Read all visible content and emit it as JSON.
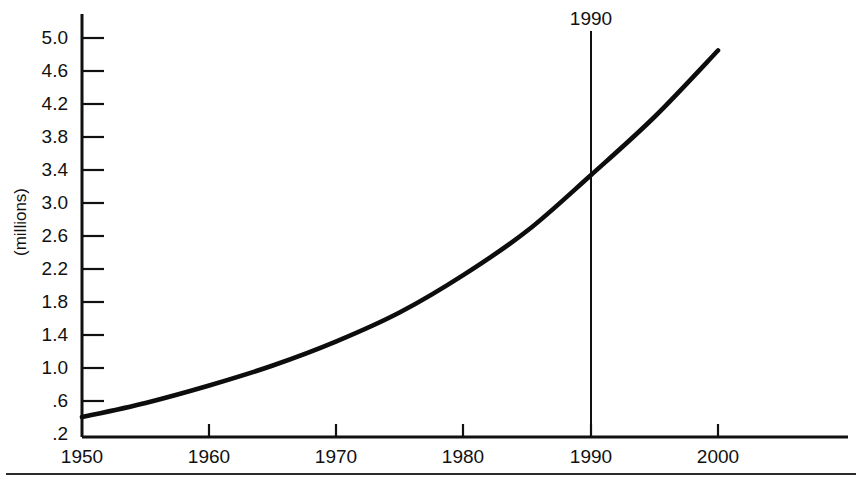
{
  "chart_data": {
    "type": "line",
    "title": "",
    "xlabel": "",
    "ylabel": "(millions)",
    "xlim": [
      1950,
      2006
    ],
    "ylim": [
      0.2,
      5.2
    ],
    "grid": false,
    "legend": null,
    "x_tick_labels": [
      "1950",
      "1960",
      "1970",
      "1980",
      "1990",
      "2000"
    ],
    "x_ticks": [
      1950,
      1960,
      1970,
      1980,
      1990,
      2000
    ],
    "y_tick_labels": [
      ".2",
      ".6",
      "1.0",
      "1.4",
      "1.8",
      "2.2",
      "2.6",
      "3.0",
      "3.4",
      "3.8",
      "4.2",
      "4.6",
      "5.0"
    ],
    "y_ticks": [
      0.2,
      0.6,
      1.0,
      1.4,
      1.8,
      2.2,
      2.6,
      3.0,
      3.4,
      3.8,
      4.2,
      4.6,
      5.0
    ],
    "annotations": [
      {
        "name": "year-marker",
        "label": "1990",
        "x": 1990,
        "type": "vertical-line"
      }
    ],
    "series": [
      {
        "name": "population",
        "x": [
          1950,
          1955,
          1960,
          1965,
          1970,
          1975,
          1980,
          1985,
          1990,
          1995,
          2000
        ],
        "values": [
          0.44,
          0.61,
          0.82,
          1.06,
          1.35,
          1.7,
          2.15,
          2.68,
          3.35,
          4.05,
          4.85
        ]
      }
    ]
  },
  "axis": {
    "y_title": "(millions)"
  },
  "marker": {
    "label": "1990"
  },
  "colors": {
    "curve": "#0d0d0d",
    "axis": "#111111",
    "background": "#ffffff"
  }
}
